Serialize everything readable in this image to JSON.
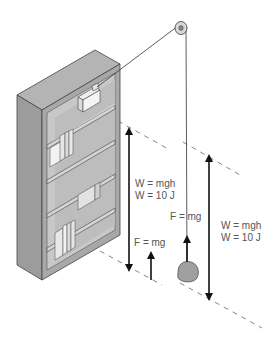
{
  "diagram": {
    "labels": {
      "work_left_line1": "W = mgh",
      "work_left_line2": "W = 10 J",
      "force_left": "F = mg",
      "force_rock": "F = mg",
      "work_right_line1": "W = mgh",
      "work_right_line2": "W = 10 J"
    },
    "objects": [
      "bookcase",
      "box",
      "pulley",
      "rope",
      "rock",
      "height-arrow-left",
      "height-arrow-right",
      "force-arrow-box",
      "force-arrow-rock"
    ],
    "colors": {
      "bookcase_fill": "#a8a8a8",
      "bookcase_dark": "#8a8a8a",
      "bookcase_light": "#c4c4c4",
      "line": "#222222",
      "label": "#555555",
      "dash": "#777777",
      "rock": "#9a9a9a"
    }
  }
}
